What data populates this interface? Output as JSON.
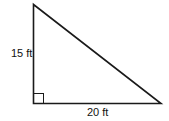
{
  "diagram": {
    "type": "right-triangle",
    "vertical_leg_label": "15 ft",
    "horizontal_leg_label": "20 ft",
    "right_angle_marker": true,
    "stroke_color": "#1a1a1a"
  }
}
